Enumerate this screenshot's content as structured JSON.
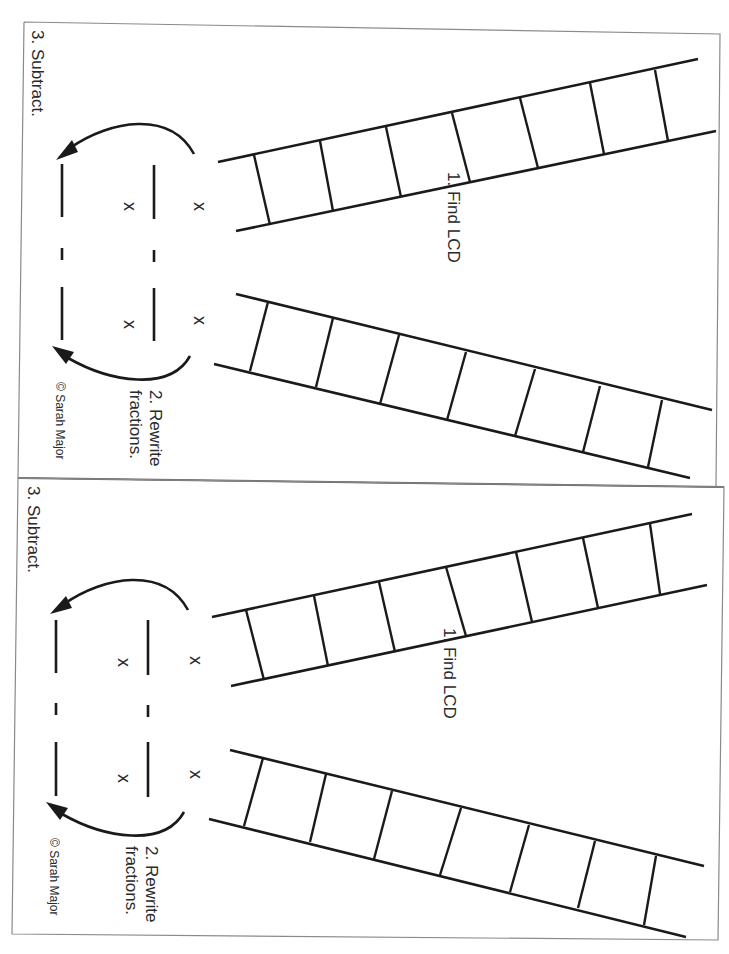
{
  "worksheet": {
    "panels": [
      {
        "id": "top",
        "step1_label": "1. Find LCD",
        "step2_line1": "2. Rewrite",
        "step2_line2": "fractions.",
        "step3_label": "3. Subtract.",
        "copyright": "© Sarah Major",
        "multiply_symbol": "x",
        "minus_symbol": "-",
        "ladder_upper_rungs": 7,
        "ladder_lower_rungs": 7
      },
      {
        "id": "bottom",
        "step1_label": "1. Find LCD",
        "step2_line1": "2. Rewrite",
        "step2_line2": "fractions.",
        "step3_label": "3. Subtract.",
        "copyright": "© Sarah Major",
        "multiply_symbol": "x",
        "minus_symbol": "-",
        "ladder_upper_rungs": 7,
        "ladder_lower_rungs": 7
      }
    ],
    "colors": {
      "ink": "#1a1a1a",
      "border": "#8a8a8a",
      "paper": "#ffffff"
    }
  }
}
